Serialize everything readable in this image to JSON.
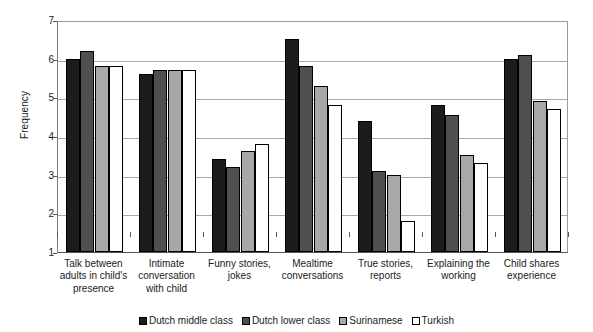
{
  "chart_data": {
    "type": "bar",
    "title": "",
    "subtitle": "",
    "xlabel": "",
    "ylabel": "Frequency",
    "ylim": [
      1,
      7
    ],
    "yticks": [
      1,
      2,
      3,
      4,
      5,
      6,
      7
    ],
    "ytick_labels": [
      "1",
      "2",
      "3",
      "4",
      "5",
      "6",
      "7"
    ],
    "grid": "horizontal",
    "legend_position": "bottom-center",
    "categories": [
      "Talk between adults in child's presence",
      "Intimate conversation with child",
      "Funny stories, jokes",
      "Mealtime conversations",
      "True stories, reports",
      "Explaining the working",
      "Child shares experience"
    ],
    "category_lines": [
      [
        "Talk between",
        "adults in child's",
        "presence"
      ],
      [
        "Intimate",
        "conversation",
        "with child"
      ],
      [
        "Funny stories,",
        "jokes"
      ],
      [
        "Mealtime",
        "conversations"
      ],
      [
        "True stories,",
        "reports"
      ],
      [
        "Explaining the",
        "working"
      ],
      [
        "Child shares",
        "experience"
      ]
    ],
    "series": [
      {
        "name": "Dutch middle class",
        "color": "#1c1c1c",
        "values": [
          6.0,
          5.6,
          3.4,
          6.5,
          4.4,
          4.8,
          6.0
        ]
      },
      {
        "name": "Dutch lower class",
        "color": "#4f4f4f",
        "values": [
          6.2,
          5.7,
          3.2,
          5.8,
          3.1,
          4.55,
          6.1
        ]
      },
      {
        "name": "Surinamese",
        "color": "#a8a8a8",
        "values": [
          5.8,
          5.7,
          3.6,
          5.3,
          3.0,
          3.5,
          4.9
        ]
      },
      {
        "name": "Turkish",
        "color": "#ffffff",
        "values": [
          5.8,
          5.7,
          3.8,
          4.8,
          1.8,
          3.3,
          4.7
        ]
      }
    ]
  }
}
